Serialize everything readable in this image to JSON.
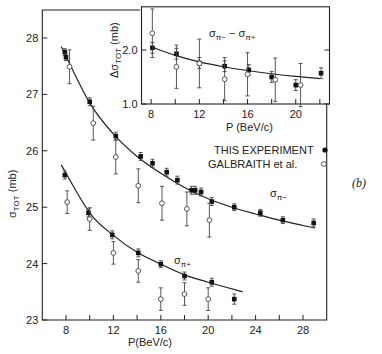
{
  "figure": {
    "panel_label": "(b)",
    "legend": {
      "this_experiment": "THIS EXPERIMENT",
      "galbraith": "GALBRAITH et al."
    }
  },
  "chart_data": [
    {
      "type": "scatter",
      "title": "",
      "xlabel": "P(BeV/c)",
      "ylabel": "σ_TOT (mb)",
      "xlim": [
        6,
        30
      ],
      "ylim": [
        23,
        28.5
      ],
      "xticks": [
        8,
        12,
        16,
        20,
        24,
        28
      ],
      "xminor": [
        10,
        14,
        18,
        22,
        26
      ],
      "yticks": [
        23,
        24,
        25,
        26,
        27,
        28
      ],
      "grid": false,
      "legend_position": "middle-right",
      "annotations": [
        "σπ-",
        "σπ+",
        "(b)"
      ],
      "series": [
        {
          "name": "σπ- THIS EXPERIMENT",
          "marker": "filled",
          "points": [
            {
              "x": 7.9,
              "y": 27.75,
              "err": 0.06
            },
            {
              "x": 8.0,
              "y": 27.66,
              "err": 0.06
            },
            {
              "x": 10.0,
              "y": 26.87,
              "err": 0.07
            },
            {
              "x": 12.2,
              "y": 26.26,
              "err": 0.07
            },
            {
              "x": 14.3,
              "y": 25.9,
              "err": 0.07
            },
            {
              "x": 15.3,
              "y": 25.78,
              "err": 0.07
            },
            {
              "x": 16.5,
              "y": 25.62,
              "err": 0.07
            },
            {
              "x": 17.4,
              "y": 25.48,
              "err": 0.07
            },
            {
              "x": 18.6,
              "y": 25.3,
              "err": 0.07
            },
            {
              "x": 18.9,
              "y": 25.3,
              "err": 0.07
            },
            {
              "x": 19.4,
              "y": 25.27,
              "err": 0.07
            },
            {
              "x": 20.3,
              "y": 25.1,
              "err": 0.07
            },
            {
              "x": 22.2,
              "y": 25.0,
              "err": 0.06
            },
            {
              "x": 24.4,
              "y": 24.9,
              "err": 0.06
            },
            {
              "x": 26.3,
              "y": 24.77,
              "err": 0.06
            },
            {
              "x": 28.9,
              "y": 24.72,
              "err": 0.07
            }
          ]
        },
        {
          "name": "σπ- GALBRAITH et al.",
          "marker": "open",
          "points": [
            {
              "x": 8.3,
              "y": 27.49,
              "err": 0.3
            },
            {
              "x": 10.3,
              "y": 26.49,
              "err": 0.3
            },
            {
              "x": 12.2,
              "y": 25.89,
              "err": 0.3
            },
            {
              "x": 14.1,
              "y": 25.38,
              "err": 0.3
            },
            {
              "x": 16.1,
              "y": 25.07,
              "err": 0.3
            },
            {
              "x": 18.2,
              "y": 24.97,
              "err": 0.3
            },
            {
              "x": 20.1,
              "y": 24.77,
              "err": 0.3
            }
          ]
        },
        {
          "name": "σπ+ THIS EXPERIMENT",
          "marker": "filled",
          "points": [
            {
              "x": 7.9,
              "y": 25.57,
              "err": 0.07
            },
            {
              "x": 9.9,
              "y": 24.9,
              "err": 0.07
            },
            {
              "x": 11.9,
              "y": 24.51,
              "err": 0.07
            },
            {
              "x": 14.1,
              "y": 24.19,
              "err": 0.07
            },
            {
              "x": 16.0,
              "y": 23.99,
              "err": 0.06
            },
            {
              "x": 18.0,
              "y": 23.78,
              "err": 0.07
            },
            {
              "x": 20.3,
              "y": 23.67,
              "err": 0.07
            },
            {
              "x": 22.2,
              "y": 23.37,
              "err": 0.09
            }
          ]
        },
        {
          "name": "σπ+ GALBRAITH et al.",
          "marker": "open",
          "points": [
            {
              "x": 8.1,
              "y": 25.09,
              "err": 0.2
            },
            {
              "x": 10.0,
              "y": 24.79,
              "err": 0.2
            },
            {
              "x": 12.0,
              "y": 24.19,
              "err": 0.2
            },
            {
              "x": 14.1,
              "y": 23.87,
              "err": 0.2
            },
            {
              "x": 16.0,
              "y": 23.37,
              "err": 0.2
            },
            {
              "x": 18.0,
              "y": 23.46,
              "err": 0.2
            },
            {
              "x": 20.0,
              "y": 23.37,
              "err": 0.2
            }
          ]
        }
      ],
      "fit_curves": [
        {
          "name": "σπ- fit",
          "x": [
            7.6,
            10,
            12,
            14,
            16,
            18,
            20,
            22,
            24,
            26,
            29
          ],
          "y": [
            27.85,
            26.85,
            26.3,
            25.9,
            25.6,
            25.35,
            25.15,
            25.0,
            24.88,
            24.77,
            24.63
          ]
        },
        {
          "name": "σπ+ fit",
          "x": [
            7.6,
            10,
            12,
            14,
            16,
            18,
            20,
            22.9
          ],
          "y": [
            25.75,
            24.9,
            24.5,
            24.2,
            23.99,
            23.8,
            23.67,
            23.5
          ]
        }
      ]
    },
    {
      "type": "scatter",
      "title": "σπ- − σπ+",
      "xlabel": "P (BeV/c)",
      "ylabel": "Δσ_TOT (mb)",
      "xlim": [
        7.2,
        22.8
      ],
      "ylim": [
        1.0,
        2.8
      ],
      "xticks": [
        8,
        12,
        16,
        20
      ],
      "xminor": [
        10,
        14,
        18,
        22
      ],
      "yticks": [
        1.0,
        2.0
      ],
      "grid": false,
      "series": [
        {
          "name": "THIS EXPERIMENT",
          "marker": "filled",
          "points": [
            {
              "x": 8.1,
              "y": 2.04,
              "err": 0.1
            },
            {
              "x": 10.1,
              "y": 1.93,
              "err": 0.1
            },
            {
              "x": 12.0,
              "y": 1.76,
              "err": 0.1
            },
            {
              "x": 14.1,
              "y": 1.7,
              "err": 0.1
            },
            {
              "x": 16.1,
              "y": 1.63,
              "err": 0.1
            },
            {
              "x": 18.0,
              "y": 1.5,
              "err": 0.1
            },
            {
              "x": 20.0,
              "y": 1.35,
              "err": 0.1
            },
            {
              "x": 22.1,
              "y": 1.57,
              "err": 0.1
            }
          ]
        },
        {
          "name": "GALBRAITH et al.",
          "marker": "open",
          "points": [
            {
              "x": 8.1,
              "y": 2.31,
              "err": 0.45
            },
            {
              "x": 10.1,
              "y": 1.69,
              "err": 0.4
            },
            {
              "x": 12.0,
              "y": 1.75,
              "err": 0.45
            },
            {
              "x": 14.1,
              "y": 1.46,
              "err": 0.4
            },
            {
              "x": 16.0,
              "y": 1.55,
              "err": 0.4
            },
            {
              "x": 18.3,
              "y": 1.45,
              "err": 0.4
            },
            {
              "x": 20.4,
              "y": 1.35,
              "err": 0.4
            }
          ]
        }
      ],
      "fit_curves": [
        {
          "name": "Δσ fit",
          "x": [
            8,
            10,
            12,
            14,
            16,
            18,
            20,
            22
          ],
          "y": [
            2.06,
            1.9,
            1.78,
            1.69,
            1.62,
            1.56,
            1.51,
            1.47
          ]
        }
      ]
    }
  ]
}
